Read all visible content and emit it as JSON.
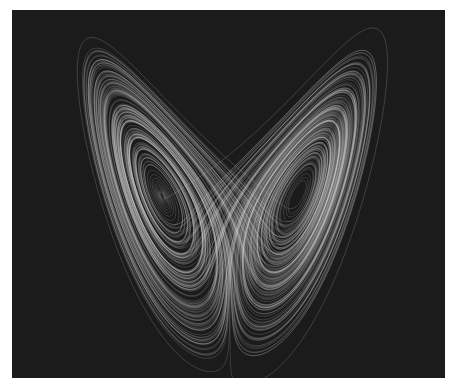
{
  "figure": {
    "title": "Lorenz attractor",
    "background_color": "#1b1b1b",
    "page_color": "#ffffff",
    "trace_color": "#d8d8d8",
    "projection": "x-z"
  },
  "attractor": {
    "sigma": 10,
    "rho": 28,
    "beta": 2.6667,
    "dt": 0.004,
    "steps": 60000,
    "center_x_px": 218,
    "z_ref": 27,
    "y_ref_px": 186,
    "scale_x": 8.0,
    "scale_z": 7.7
  }
}
